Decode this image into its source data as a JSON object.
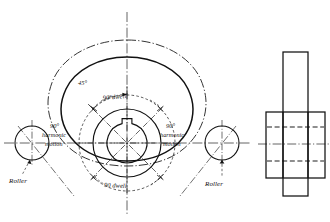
{
  "drawing": {
    "title": "Plate cam with roller follower — layout and side elevation",
    "line_color": "#111111",
    "background": "#ffffff"
  },
  "labels": {
    "angle_45": "45°",
    "dwell_top": "90°dwell",
    "dwell_bottom": "90 dwell",
    "harmonic_left_line1": "90°",
    "harmonic_left_line2": "harmonic",
    "harmonic_left_line3": "motion",
    "harmonic_right_line1": "90°",
    "harmonic_right_line2": "harmonic",
    "harmonic_right_line3": "motion",
    "roller_left": "Roller",
    "roller_right": "Roller"
  },
  "cam_geometry": {
    "center_x": 127,
    "center_y": 143,
    "major_radius": 86,
    "minor_radius": 40,
    "base_circle_radius": 48,
    "hub_outer_radius": 34,
    "bore_radius": 20,
    "roller_radius": 17,
    "roller_left_center_x": 32,
    "roller_right_center_x": 222,
    "segments": [
      {
        "name": "top-dwell",
        "span_deg": 90,
        "type": "constant-radius"
      },
      {
        "name": "right-harmonic",
        "span_deg": 90,
        "type": "harmonic"
      },
      {
        "name": "bottom-dwell",
        "span_deg": 90,
        "type": "constant-radius"
      },
      {
        "name": "left-harmonic",
        "span_deg": 90,
        "type": "harmonic"
      }
    ],
    "index_tick_interval_deg": 45
  },
  "elevation": {
    "plate_left": 283,
    "plate_right": 308,
    "plate_top": 52,
    "plate_bottom": 196,
    "hub_left": 266,
    "hub_right": 325,
    "hub_top": 112,
    "hub_bottom": 178,
    "bore_top": 127,
    "bore_bottom": 161
  }
}
